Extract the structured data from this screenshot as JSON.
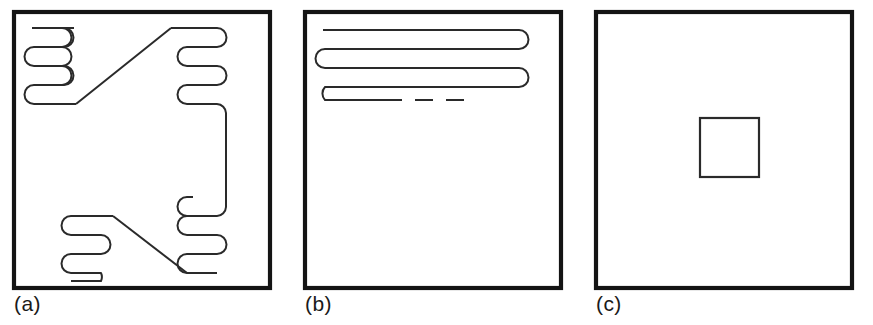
{
  "figure": {
    "background_color": "#ffffff",
    "line_color": "#2a2a2a",
    "frame_color": "#141414",
    "panel_count": 3
  },
  "panels": [
    {
      "id": "a",
      "caption": "(a)",
      "description": "Square frame containing two diagonally linked serpentine meander coils, upper-left and lower-left, joined to mirrored right-hand coils by straight diagonal runs and a vertical connector along the right side.",
      "frame": {
        "x": 14,
        "y": 12,
        "width": 256,
        "height": 276
      },
      "elements": [
        {
          "name": "serpentine-top-left",
          "turns": 4,
          "orientation": "horizontal",
          "turn_side": "right"
        },
        {
          "name": "diagonal-link-top",
          "type": "diagonal"
        },
        {
          "name": "serpentine-top-right",
          "turns": 4,
          "orientation": "horizontal",
          "turn_side": "right"
        },
        {
          "name": "vertical-connector-right",
          "type": "vertical"
        },
        {
          "name": "serpentine-bottom-right",
          "turns": 4,
          "orientation": "horizontal",
          "turn_side": "right"
        },
        {
          "name": "diagonal-link-bottom",
          "type": "diagonal"
        },
        {
          "name": "serpentine-bottom-left",
          "turns": 4,
          "orientation": "horizontal",
          "turn_side": "right"
        }
      ]
    },
    {
      "id": "b",
      "caption": "(b)",
      "description": "Square frame containing a single wide horizontal serpentine of four long parallel runs occupying the upper region, with the final run trailing off as a dashed line.",
      "frame": {
        "x": 14,
        "y": 12,
        "width": 256,
        "height": 276
      },
      "elements": [
        {
          "name": "serpentine-wide",
          "runs": 4,
          "orientation": "horizontal",
          "turns": 3
        },
        {
          "name": "dashed-continuation",
          "type": "dashed-line"
        }
      ]
    },
    {
      "id": "c",
      "caption": "(c)",
      "description": "Empty square frame containing only a small centered square outline.",
      "frame": {
        "x": 14,
        "y": 12,
        "width": 256,
        "height": 276
      },
      "elements": [
        {
          "name": "inner-square",
          "x": 118,
          "y": 118,
          "width": 59,
          "height": 59
        }
      ]
    }
  ]
}
